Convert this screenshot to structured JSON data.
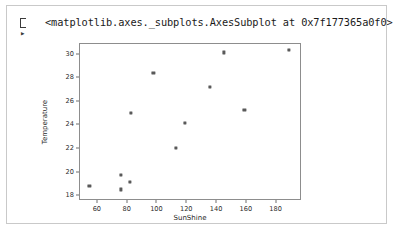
{
  "cell": {
    "prompt_marker": "output-prompt",
    "repr_text": "<matplotlib.axes._subplots.AxesSubplot at 0x7f177365a0f0>"
  },
  "colors": {
    "marker": "#595959",
    "axes_spine": "#8d8d8d",
    "cell_border": "#c9c9c9",
    "text": "#1a1a1a",
    "background": "#ffffff"
  },
  "chart_data": {
    "type": "scatter",
    "title": "",
    "xlabel": "SunShine",
    "ylabel": "Temperature",
    "xlim": [
      48,
      197
    ],
    "ylim": [
      17.6,
      30.9
    ],
    "xticks": [
      60,
      80,
      100,
      120,
      140,
      160,
      180
    ],
    "yticks": [
      18,
      20,
      22,
      24,
      26,
      28,
      30
    ],
    "grid": false,
    "legend": null,
    "marker_style": "square",
    "points": [
      {
        "x": 55,
        "y": 18.8
      },
      {
        "x": 76,
        "y": 19.7
      },
      {
        "x": 76,
        "y": 18.5
      },
      {
        "x": 82,
        "y": 19.1
      },
      {
        "x": 83,
        "y": 25.0
      },
      {
        "x": 98,
        "y": 28.4
      },
      {
        "x": 113,
        "y": 22.0
      },
      {
        "x": 119,
        "y": 24.1
      },
      {
        "x": 136,
        "y": 27.2
      },
      {
        "x": 145,
        "y": 30.1
      },
      {
        "x": 159,
        "y": 25.2
      },
      {
        "x": 189,
        "y": 30.3
      }
    ]
  }
}
